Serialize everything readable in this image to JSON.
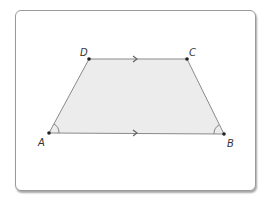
{
  "figure": {
    "shape": "trapezoid",
    "fill_color": "#ececec",
    "stroke_color": "#888888",
    "point_color": "#222222",
    "vertices": [
      {
        "label": "A",
        "x": 49,
        "y": 133,
        "label_x": 38,
        "label_y": 146
      },
      {
        "label": "B",
        "x": 224,
        "y": 134,
        "label_x": 227,
        "label_y": 147
      },
      {
        "label": "C",
        "x": 187,
        "y": 59,
        "label_x": 189,
        "label_y": 56
      },
      {
        "label": "D",
        "x": 89,
        "y": 59,
        "label_x": 80,
        "label_y": 56
      }
    ],
    "parallel_marks": [
      {
        "side": "DC",
        "x": 135,
        "y": 59
      },
      {
        "side": "AB",
        "x": 135,
        "y": 133
      }
    ],
    "congruent_angle_marks": [
      "A",
      "B"
    ]
  }
}
